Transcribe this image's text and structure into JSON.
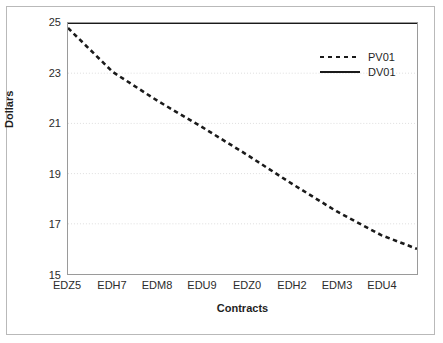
{
  "chart_data": {
    "type": "line",
    "title": "",
    "xlabel": "Contracts",
    "ylabel": "Dollars",
    "ylim": [
      15,
      25
    ],
    "yticks": [
      15,
      17,
      19,
      21,
      23,
      25
    ],
    "ytick_labels": [
      "15",
      "17",
      "19",
      "21",
      "23",
      "25"
    ],
    "grid": true,
    "grid_style": "dotted",
    "grid_axis": "y",
    "legend_position": "upper right",
    "x_major_labels": [
      "EDZ5",
      "EDH7",
      "EDM8",
      "EDU9",
      "EDZ0",
      "EDH2",
      "EDM3",
      "EDU4"
    ],
    "x_minor_tick_count": 40,
    "x_major_tick_every": 5,
    "x_index_range": [
      0,
      39
    ],
    "series": [
      {
        "name": "PV01",
        "style": "dashed",
        "color": "#1a1a1a",
        "x": [
          0,
          5,
          10,
          15,
          20,
          25,
          30,
          35,
          39
        ],
        "values": [
          24.8,
          23.05,
          21.9,
          20.85,
          19.75,
          18.6,
          17.5,
          16.55,
          16.0
        ]
      },
      {
        "name": "DV01",
        "style": "solid",
        "color": "#1a1a1a",
        "x": [
          0,
          39
        ],
        "values": [
          25.0,
          25.0
        ]
      }
    ],
    "legend": [
      {
        "label": "PV01",
        "style": "dashed"
      },
      {
        "label": "DV01",
        "style": "solid"
      }
    ]
  }
}
